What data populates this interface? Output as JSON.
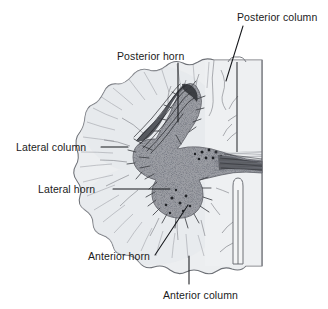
{
  "figure": {
    "style": "grayscale-line-drawing",
    "colors": {
      "background": "#ffffff",
      "white_matter": "#eceef0",
      "white_matter_edge": "#6c6f74",
      "gray_matter": "#7d7f85",
      "gray_matter_dark": "#3c3d42",
      "leader_line": "#16181c",
      "label_text": "#1b1b1b"
    }
  },
  "labels": [
    {
      "id": "posterior-column",
      "text": "Posterior column"
    },
    {
      "id": "posterior-horn",
      "text": "Posterior horn"
    },
    {
      "id": "lateral-column",
      "text": "Lateral column"
    },
    {
      "id": "lateral-horn",
      "text": "Lateral horn"
    },
    {
      "id": "anterior-horn",
      "text": "Anterior horn"
    },
    {
      "id": "anterior-column",
      "text": "Anterior column"
    }
  ],
  "structures": {
    "posterior_median_sulcus": "posterior median sulcus",
    "anterior_median_fissure": "anterior median fissure",
    "gray_commissure": "gray commissure",
    "midline": "midline cut edge"
  }
}
